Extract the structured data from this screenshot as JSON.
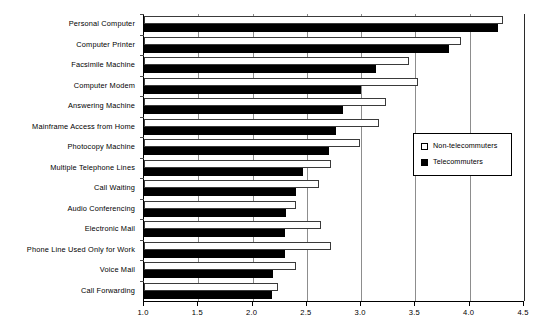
{
  "chart_data": {
    "type": "bar",
    "orientation": "horizontal",
    "title": "",
    "xlabel": "",
    "ylabel": "",
    "xlim": [
      1.0,
      4.5
    ],
    "xticks": [
      "1.0",
      "1.5",
      "2.0",
      "2.5",
      "3.0",
      "3.5",
      "4.0",
      "4.5"
    ],
    "xtick_values": [
      1.0,
      1.5,
      2.0,
      2.5,
      3.0,
      3.5,
      4.0,
      4.5
    ],
    "grid": true,
    "grid_axis": "x",
    "legend_position": "center-right",
    "categories": [
      "Personal Computer",
      "Computer Printer",
      "Facsimile Machine",
      "Computer Modem",
      "Answering Machine",
      "Mainframe Access from Home",
      "Photocopy Machine",
      "Multiple Telephone Lines",
      "Call Waiting",
      "Audio Conferencing",
      "Electronic Mail",
      "Phone Line Used Only for Work",
      "Voice Mail",
      "Call Forwarding"
    ],
    "series": [
      {
        "name": "Non-telecommuters",
        "color": "#ffffff",
        "edge_color": "#000000",
        "values": [
          4.31,
          3.92,
          3.44,
          3.52,
          3.23,
          3.16,
          2.99,
          2.72,
          2.61,
          2.4,
          2.63,
          2.72,
          2.4,
          2.23
        ]
      },
      {
        "name": "Telecommuters",
        "color": "#000000",
        "edge_color": "#000000",
        "values": [
          4.26,
          3.81,
          3.14,
          3.0,
          2.83,
          2.77,
          2.7,
          2.46,
          2.4,
          2.31,
          2.3,
          2.3,
          2.19,
          2.18
        ]
      }
    ]
  },
  "legend": {
    "items": [
      {
        "label": "Non-telecommuters",
        "swatch": "open-square-icon"
      },
      {
        "label": "Telecommuters",
        "swatch": "filled-square-icon"
      }
    ]
  }
}
